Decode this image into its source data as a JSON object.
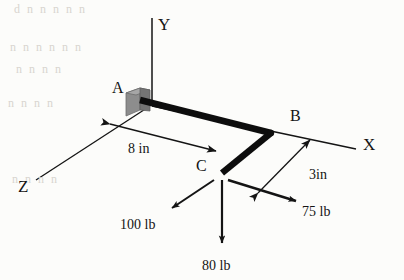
{
  "figure": {
    "background_color": "#fcfcfa",
    "line_color": "#141414",
    "beam_color": "#0d0d0d",
    "support_color": "#8a8a8a"
  },
  "axes": [
    {
      "name": "y-axis",
      "label": "Y",
      "label_x": 158,
      "label_y": 16
    },
    {
      "name": "x-axis",
      "label": "X",
      "label_x": 363,
      "label_y": 136
    },
    {
      "name": "z-axis",
      "label": "Z",
      "label_x": 18,
      "label_y": 178
    }
  ],
  "points": [
    {
      "name": "point-a",
      "label": "A",
      "label_x": 112,
      "label_y": 80
    },
    {
      "name": "point-b",
      "label": "B",
      "label_x": 290,
      "label_y": 108
    },
    {
      "name": "point-c",
      "label": "C",
      "label_x": 196,
      "label_y": 158
    }
  ],
  "dimensions": [
    {
      "name": "dimension-8in",
      "label": "8 in",
      "label_x": 128,
      "label_y": 142
    },
    {
      "name": "dimension-3in",
      "label": "3in",
      "label_x": 309,
      "label_y": 168
    }
  ],
  "forces": [
    {
      "name": "force-100lb",
      "label": "100 lb",
      "label_x": 120,
      "label_y": 218,
      "direction": "down-left"
    },
    {
      "name": "force-80lb",
      "label": "80 lb",
      "label_x": 202,
      "label_y": 259,
      "direction": "down"
    },
    {
      "name": "force-75lb",
      "label": "75 lb",
      "label_x": 302,
      "label_y": 205,
      "direction": "right-down"
    }
  ],
  "support": {
    "name": "wall-support-block",
    "description": "fixed support block at A"
  },
  "scan_artifacts": [
    {
      "text": "d  n     n      n  n   n",
      "x": 14,
      "y": 2
    },
    {
      "text": "n      n    n       n    n   n",
      "x": 10,
      "y": 40
    },
    {
      "text": "n        n     n    n",
      "x": 16,
      "y": 62
    },
    {
      "text": "n     n      n   n",
      "x": 8,
      "y": 96
    },
    {
      "text": "n     n    n      n",
      "x": 12,
      "y": 172
    }
  ]
}
